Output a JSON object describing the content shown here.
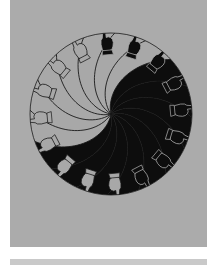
{
  "artwork": {
    "title": "Spiral of Hands",
    "description": "Circular radial spiral composition with black and grey interleaved spiral arms and a ring of outlined pointing-hand silhouettes around the rim",
    "medium": "ink drawing reproduction on grey ground"
  },
  "canvas": {
    "width": 212,
    "height": 265,
    "background_color": "#ffffff"
  },
  "panel": {
    "x": 10,
    "y": 0,
    "width": 197,
    "height": 247,
    "background_color": "#ababab"
  },
  "bottom_band": {
    "x": 10,
    "y": 259,
    "width": 197,
    "height": 6,
    "color": "#c9c9c9"
  },
  "circle": {
    "center_x": 101,
    "center_y": 114,
    "radius": 81,
    "inner_radius": 66
  },
  "colors": {
    "ground": "#ababab",
    "dark_fill": "#0d0d0d",
    "light_fill": "#a8a8a8",
    "line": "#1a1a1a",
    "white": "#ffffff",
    "band": "#c9c9c9"
  },
  "spiral": {
    "arm_count": 16,
    "turn_degrees": 62,
    "dark_start_index": 0,
    "dark_end_index": 8,
    "stroke_width": 0.9
  },
  "hands": {
    "count": 16,
    "ring_radius": 73,
    "note": "outlined mitten / pointing-hand silhouettes arrayed clockwise around the circle rim"
  }
}
